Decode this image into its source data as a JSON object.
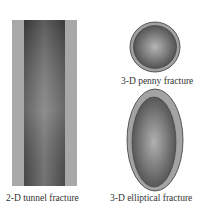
{
  "figures": [
    {
      "id": "tunnel",
      "label": "2-D tunnel fracture"
    },
    {
      "id": "penny",
      "label": "3-D penny fracture"
    },
    {
      "id": "elliptical",
      "label": "3-D elliptical fracture"
    }
  ],
  "colors": {
    "outer_band": "#a6a6a6",
    "inner_dark": "#555555",
    "inner_light": "#b8b8b8",
    "outline": "#3a3a3a"
  }
}
